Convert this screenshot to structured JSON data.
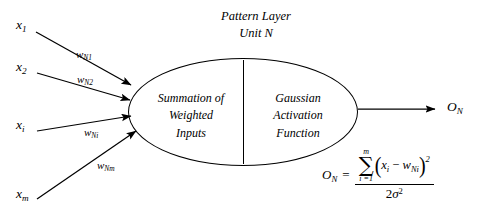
{
  "diagram": {
    "title": {
      "line1": "Pattern Layer",
      "line2": "Unit N"
    },
    "node": {
      "left_section": {
        "line1": "Summation of",
        "line2": "Weighted",
        "line3": "Inputs"
      },
      "right_section": {
        "line1": "Gaussian",
        "line2": "Activation",
        "line3": "Function"
      }
    },
    "inputs": [
      {
        "var_base": "x",
        "var_sub": "1",
        "weight_base": "w",
        "weight_sub": "N1"
      },
      {
        "var_base": "x",
        "var_sub": "2",
        "weight_base": "w",
        "weight_sub": "N2"
      },
      {
        "var_base": "x",
        "var_sub": "i",
        "weight_base": "w",
        "weight_sub": "Ni"
      },
      {
        "var_base": "x",
        "var_sub": "m",
        "weight_base": "w",
        "weight_sub": "Nm"
      }
    ],
    "output": {
      "base": "O",
      "sub": "N"
    },
    "formula": {
      "lhs_base": "O",
      "lhs_sub": "N",
      "equals": "=",
      "sum_upper": "m",
      "sum_lower": "i =1",
      "sum_glyph": "∑",
      "paren_open": "(",
      "paren_close": ")",
      "numerator_body": "x",
      "numerator_var_sub": "i",
      "numerator_minus": "−",
      "numerator_weight": "w",
      "numerator_weight_sub": "Ni",
      "numerator_power": "2",
      "denominator_coef": "2",
      "denominator_sigma": "σ",
      "denominator_power": "2"
    },
    "colors": {
      "ink": "#000000",
      "background": "#ffffff"
    }
  }
}
